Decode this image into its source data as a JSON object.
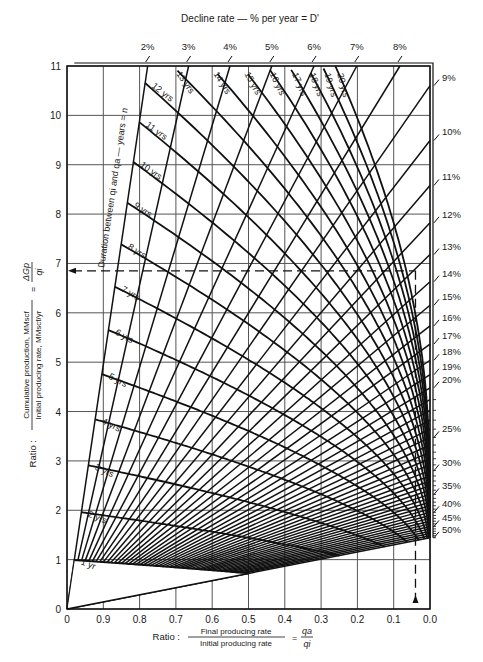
{
  "chart_data": {
    "type": "line",
    "top_axis_title": "Decline rate — % per year = D'",
    "xlabel": "Ratio : Final producing rate / Initial producing rate = qa/qi",
    "xlabel_prefix": "Ratio :",
    "xlabel_num": "Final producing rate",
    "xlabel_den": "Initial producing rate",
    "xlabel_sym_num": "qa",
    "xlabel_sym_den": "qi",
    "ylabel": "Ratio : Cumulative production, MMscf / Initial producing rate, MMscf/yr = ΔGp/qi",
    "ylabel_prefix": "Ratio :",
    "ylabel_num": "Cumulative production, MMscf",
    "ylabel_den": "Initial producing rate, MMscf/yr",
    "ylabel_sym_num": "ΔGp",
    "ylabel_sym_den": "qi",
    "duration_label": "Duration between qi and qa — years = n",
    "xlim": [
      1.0,
      0.0
    ],
    "ylim": [
      0,
      11
    ],
    "x_ticks": [
      1.0,
      0.9,
      0.8,
      0.7,
      0.6,
      0.5,
      0.4,
      0.3,
      0.2,
      0.1,
      0.0
    ],
    "x_tick_labels": [
      "0",
      "0.9",
      "0.8",
      "0.7",
      "0.6",
      "0.5",
      "0.4",
      "0.3",
      "0.2",
      "0.1",
      "0.0"
    ],
    "y_ticks": [
      0,
      1,
      2,
      3,
      4,
      5,
      6,
      7,
      8,
      9,
      10,
      11
    ],
    "grid": true,
    "decline_rate_series": {
      "description": "Rays: constant nominal annual decline D'; dGp/qi = (1 - qa/qi) / -ln(1-D')",
      "top_labels": [
        "2%",
        "3%",
        "4%",
        "5%",
        "6%",
        "7%",
        "8%"
      ],
      "right_labels": [
        "9%",
        "10%",
        "11%",
        "12%",
        "13%",
        "14%",
        "15%",
        "16%",
        "17%",
        "18%",
        "19%",
        "20%",
        "25%",
        "30%",
        "35%",
        "40%",
        "45%",
        "50%"
      ],
      "rates_percent": [
        2,
        3,
        4,
        5,
        6,
        7,
        8,
        9,
        10,
        11,
        12,
        13,
        14,
        15,
        16,
        17,
        18,
        19,
        20,
        21,
        22,
        23,
        24,
        25,
        26,
        27,
        28,
        29,
        30,
        31,
        32,
        33,
        34,
        35,
        36,
        37,
        38,
        39,
        40,
        41,
        42,
        43,
        44,
        45,
        46,
        47,
        48,
        49,
        50
      ]
    },
    "duration_series": {
      "description": "Curves: constant years n; qa/qi = (1-D')^n",
      "years": [
        1,
        2,
        3,
        4,
        5,
        6,
        7,
        8,
        9,
        10,
        11,
        12,
        13,
        14,
        15,
        16,
        17,
        18,
        19,
        20
      ],
      "labels": [
        "1 yr",
        "2 yrs",
        "3 yrs",
        "4 yrs",
        "5 yrs",
        "6 yrs",
        "7 yrs",
        "8 yrs",
        "9 yrs",
        "10 yrs",
        "11 yrs",
        "12 yrs",
        "13 yrs",
        "14 yrs",
        "15 yrs",
        "16 yrs",
        "17 yrs",
        "18 yrs",
        "19 yrs",
        "20 yrs"
      ]
    },
    "example": {
      "dGp_over_qi": 6.85,
      "qa_over_qi": 0.04
    }
  }
}
